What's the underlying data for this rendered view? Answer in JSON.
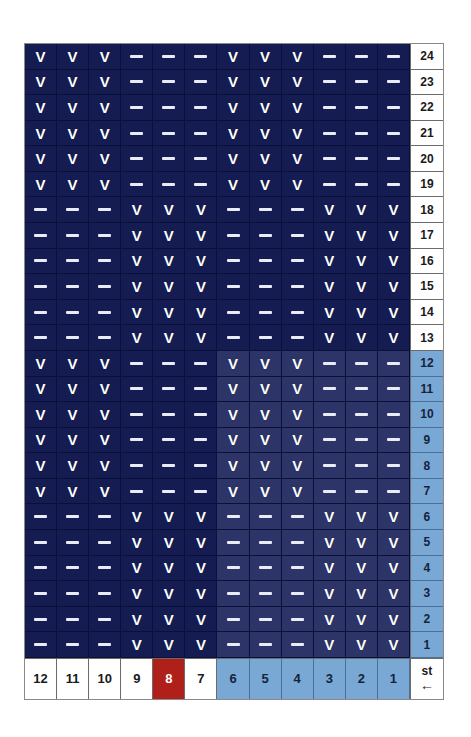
{
  "grid": {
    "marks": {
      "present": "V",
      "absent": "—"
    },
    "colors": {
      "cell_dark": "#151c52",
      "cell_light": "#2c3468",
      "number_blue": "#7aa8d4",
      "footer_red": "#b0201a",
      "mark_white": "#ffffff",
      "border": "#0a1038"
    },
    "column_count": 12,
    "row_count": 24,
    "rows": [
      {
        "number": "24",
        "number_style": "white",
        "cells": [
          "V",
          "V",
          "V",
          "-",
          "-",
          "-",
          "V",
          "V",
          "V",
          "-",
          "-",
          "-"
        ],
        "shading": [
          "dark",
          "dark",
          "dark",
          "dark",
          "dark",
          "dark",
          "dark",
          "dark",
          "dark",
          "dark",
          "dark",
          "dark"
        ]
      },
      {
        "number": "23",
        "number_style": "white",
        "cells": [
          "V",
          "V",
          "V",
          "-",
          "-",
          "-",
          "V",
          "V",
          "V",
          "-",
          "-",
          "-"
        ],
        "shading": [
          "dark",
          "dark",
          "dark",
          "dark",
          "dark",
          "dark",
          "dark",
          "dark",
          "dark",
          "dark",
          "dark",
          "dark"
        ]
      },
      {
        "number": "22",
        "number_style": "white",
        "cells": [
          "V",
          "V",
          "V",
          "-",
          "-",
          "-",
          "V",
          "V",
          "V",
          "-",
          "-",
          "-"
        ],
        "shading": [
          "dark",
          "dark",
          "dark",
          "dark",
          "dark",
          "dark",
          "dark",
          "dark",
          "dark",
          "dark",
          "dark",
          "dark"
        ]
      },
      {
        "number": "21",
        "number_style": "white",
        "cells": [
          "V",
          "V",
          "V",
          "-",
          "-",
          "-",
          "V",
          "V",
          "V",
          "-",
          "-",
          "-"
        ],
        "shading": [
          "dark",
          "dark",
          "dark",
          "dark",
          "dark",
          "dark",
          "dark",
          "dark",
          "dark",
          "dark",
          "dark",
          "dark"
        ]
      },
      {
        "number": "20",
        "number_style": "white",
        "cells": [
          "V",
          "V",
          "V",
          "-",
          "-",
          "-",
          "V",
          "V",
          "V",
          "-",
          "-",
          "-"
        ],
        "shading": [
          "dark",
          "dark",
          "dark",
          "dark",
          "dark",
          "dark",
          "dark",
          "dark",
          "dark",
          "dark",
          "dark",
          "dark"
        ]
      },
      {
        "number": "19",
        "number_style": "white",
        "cells": [
          "V",
          "V",
          "V",
          "-",
          "-",
          "-",
          "V",
          "V",
          "V",
          "-",
          "-",
          "-"
        ],
        "shading": [
          "dark",
          "dark",
          "dark",
          "dark",
          "dark",
          "dark",
          "dark",
          "dark",
          "dark",
          "dark",
          "dark",
          "dark"
        ]
      },
      {
        "number": "18",
        "number_style": "white",
        "cells": [
          "-",
          "-",
          "-",
          "V",
          "V",
          "V",
          "-",
          "-",
          "-",
          "V",
          "V",
          "V"
        ],
        "shading": [
          "dark",
          "dark",
          "dark",
          "dark",
          "dark",
          "dark",
          "dark",
          "dark",
          "dark",
          "dark",
          "dark",
          "dark"
        ]
      },
      {
        "number": "17",
        "number_style": "white",
        "cells": [
          "-",
          "-",
          "-",
          "V",
          "V",
          "V",
          "-",
          "-",
          "-",
          "V",
          "V",
          "V"
        ],
        "shading": [
          "dark",
          "dark",
          "dark",
          "dark",
          "dark",
          "dark",
          "dark",
          "dark",
          "dark",
          "dark",
          "dark",
          "dark"
        ]
      },
      {
        "number": "16",
        "number_style": "white",
        "cells": [
          "-",
          "-",
          "-",
          "V",
          "V",
          "V",
          "-",
          "-",
          "-",
          "V",
          "V",
          "V"
        ],
        "shading": [
          "dark",
          "dark",
          "dark",
          "dark",
          "dark",
          "dark",
          "dark",
          "dark",
          "dark",
          "dark",
          "dark",
          "dark"
        ]
      },
      {
        "number": "15",
        "number_style": "white",
        "cells": [
          "-",
          "-",
          "-",
          "V",
          "V",
          "V",
          "-",
          "-",
          "-",
          "V",
          "V",
          "V"
        ],
        "shading": [
          "dark",
          "dark",
          "dark",
          "dark",
          "dark",
          "dark",
          "dark",
          "dark",
          "dark",
          "dark",
          "dark",
          "dark"
        ]
      },
      {
        "number": "14",
        "number_style": "white",
        "cells": [
          "-",
          "-",
          "-",
          "V",
          "V",
          "V",
          "-",
          "-",
          "-",
          "V",
          "V",
          "V"
        ],
        "shading": [
          "dark",
          "dark",
          "dark",
          "dark",
          "dark",
          "dark",
          "dark",
          "dark",
          "dark",
          "dark",
          "dark",
          "dark"
        ]
      },
      {
        "number": "13",
        "number_style": "white",
        "cells": [
          "-",
          "-",
          "-",
          "V",
          "V",
          "V",
          "-",
          "-",
          "-",
          "V",
          "V",
          "V"
        ],
        "shading": [
          "dark",
          "dark",
          "dark",
          "dark",
          "dark",
          "dark",
          "dark",
          "dark",
          "dark",
          "dark",
          "dark",
          "dark"
        ]
      },
      {
        "number": "12",
        "number_style": "blue",
        "cells": [
          "V",
          "V",
          "V",
          "-",
          "-",
          "-",
          "V",
          "V",
          "V",
          "-",
          "-",
          "-"
        ],
        "shading": [
          "dark",
          "dark",
          "dark",
          "dark",
          "dark",
          "dark",
          "light",
          "light",
          "light",
          "light",
          "light",
          "light"
        ]
      },
      {
        "number": "11",
        "number_style": "blue",
        "cells": [
          "V",
          "V",
          "V",
          "-",
          "-",
          "-",
          "V",
          "V",
          "V",
          "-",
          "-",
          "-"
        ],
        "shading": [
          "dark",
          "dark",
          "dark",
          "dark",
          "dark",
          "dark",
          "light",
          "light",
          "light",
          "light",
          "light",
          "light"
        ]
      },
      {
        "number": "10",
        "number_style": "blue",
        "cells": [
          "V",
          "V",
          "V",
          "-",
          "-",
          "-",
          "V",
          "V",
          "V",
          "-",
          "-",
          "-"
        ],
        "shading": [
          "dark",
          "dark",
          "dark",
          "dark",
          "dark",
          "dark",
          "light",
          "light",
          "light",
          "light",
          "light",
          "light"
        ]
      },
      {
        "number": "9",
        "number_style": "blue",
        "cells": [
          "V",
          "V",
          "V",
          "-",
          "-",
          "-",
          "V",
          "V",
          "V",
          "-",
          "-",
          "-"
        ],
        "shading": [
          "dark",
          "dark",
          "dark",
          "dark",
          "dark",
          "dark",
          "light",
          "light",
          "light",
          "light",
          "light",
          "light"
        ]
      },
      {
        "number": "8",
        "number_style": "blue",
        "cells": [
          "V",
          "V",
          "V",
          "-",
          "-",
          "-",
          "V",
          "V",
          "V",
          "-",
          "-",
          "-"
        ],
        "shading": [
          "dark",
          "dark",
          "dark",
          "dark",
          "dark",
          "dark",
          "light",
          "light",
          "light",
          "light",
          "light",
          "light"
        ]
      },
      {
        "number": "7",
        "number_style": "blue",
        "cells": [
          "V",
          "V",
          "V",
          "-",
          "-",
          "-",
          "V",
          "V",
          "V",
          "-",
          "-",
          "-"
        ],
        "shading": [
          "dark",
          "dark",
          "dark",
          "dark",
          "dark",
          "dark",
          "light",
          "light",
          "light",
          "light",
          "light",
          "light"
        ]
      },
      {
        "number": "6",
        "number_style": "blue",
        "cells": [
          "-",
          "-",
          "-",
          "V",
          "V",
          "V",
          "-",
          "-",
          "-",
          "V",
          "V",
          "V"
        ],
        "shading": [
          "dark",
          "dark",
          "dark",
          "dark",
          "dark",
          "dark",
          "light",
          "light",
          "light",
          "light",
          "light",
          "light"
        ]
      },
      {
        "number": "5",
        "number_style": "blue",
        "cells": [
          "-",
          "-",
          "-",
          "V",
          "V",
          "V",
          "-",
          "-",
          "-",
          "V",
          "V",
          "V"
        ],
        "shading": [
          "dark",
          "dark",
          "dark",
          "dark",
          "dark",
          "dark",
          "light",
          "light",
          "light",
          "light",
          "light",
          "light"
        ]
      },
      {
        "number": "4",
        "number_style": "blue",
        "cells": [
          "-",
          "-",
          "-",
          "V",
          "V",
          "V",
          "-",
          "-",
          "-",
          "V",
          "V",
          "V"
        ],
        "shading": [
          "dark",
          "dark",
          "dark",
          "dark",
          "dark",
          "dark",
          "light",
          "light",
          "light",
          "light",
          "light",
          "light"
        ]
      },
      {
        "number": "3",
        "number_style": "blue",
        "cells": [
          "-",
          "-",
          "-",
          "V",
          "V",
          "V",
          "-",
          "-",
          "-",
          "V",
          "V",
          "V"
        ],
        "shading": [
          "dark",
          "dark",
          "dark",
          "dark",
          "dark",
          "dark",
          "light",
          "light",
          "light",
          "light",
          "light",
          "light"
        ]
      },
      {
        "number": "2",
        "number_style": "blue",
        "cells": [
          "-",
          "-",
          "-",
          "V",
          "V",
          "V",
          "-",
          "-",
          "-",
          "V",
          "V",
          "V"
        ],
        "shading": [
          "dark",
          "dark",
          "dark",
          "dark",
          "dark",
          "dark",
          "light",
          "light",
          "light",
          "light",
          "light",
          "light"
        ]
      },
      {
        "number": "1",
        "number_style": "blue",
        "cells": [
          "-",
          "-",
          "-",
          "V",
          "V",
          "V",
          "-",
          "-",
          "-",
          "V",
          "V",
          "V"
        ],
        "shading": [
          "dark",
          "dark",
          "dark",
          "dark",
          "dark",
          "dark",
          "light",
          "light",
          "light",
          "light",
          "light",
          "light"
        ]
      }
    ],
    "footer": {
      "cells": [
        {
          "label": "12",
          "style": "white"
        },
        {
          "label": "11",
          "style": "white"
        },
        {
          "label": "10",
          "style": "white"
        },
        {
          "label": "9",
          "style": "white"
        },
        {
          "label": "8",
          "style": "red"
        },
        {
          "label": "7",
          "style": "white"
        },
        {
          "label": "6",
          "style": "blue"
        },
        {
          "label": "5",
          "style": "blue"
        },
        {
          "label": "4",
          "style": "blue"
        },
        {
          "label": "3",
          "style": "blue"
        },
        {
          "label": "2",
          "style": "blue"
        },
        {
          "label": "1",
          "style": "blue"
        }
      ],
      "corner": {
        "label": "st",
        "arrow": "←"
      }
    }
  }
}
